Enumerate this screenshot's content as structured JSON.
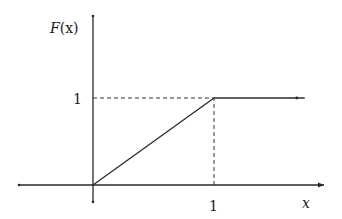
{
  "chart_data": {
    "type": "line",
    "title": "",
    "xlabel": "x",
    "ylabel": "F(x)",
    "xlim": [
      -0.6,
      1.75
    ],
    "ylim": [
      -0.2,
      1.0
    ],
    "x_ticks": [
      {
        "value": 1,
        "label": "1"
      }
    ],
    "y_ticks": [
      {
        "value": 1,
        "label": "1"
      }
    ],
    "grid": false,
    "legend": "none",
    "series": [
      {
        "name": "F(x)",
        "description": "CDF of uniform distribution on [0,1]",
        "points": [
          [
            0,
            0
          ],
          [
            1,
            1
          ],
          [
            1.75,
            1
          ]
        ]
      }
    ],
    "guides": [
      {
        "type": "dashed-horizontal",
        "from": [
          0,
          1
        ],
        "to": [
          1,
          1
        ]
      },
      {
        "type": "dashed-vertical",
        "from": [
          1,
          0
        ],
        "to": [
          1,
          1
        ]
      }
    ]
  },
  "labels": {
    "ylabel_main": "F",
    "ylabel_paren": "(x)",
    "xlabel": "x",
    "xtick": "1",
    "ytick": "1"
  }
}
